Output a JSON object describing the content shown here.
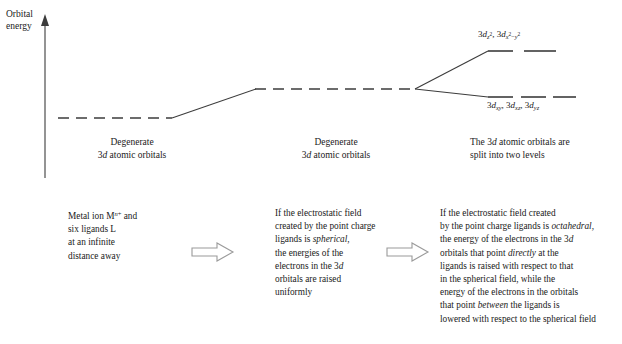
{
  "figure": {
    "axis": {
      "label_line1": "Orbital",
      "label_line2": "energy",
      "name": "orbital-energy-axis"
    },
    "stages": [
      {
        "id": "free-ion",
        "caption_line1": "Degenerate",
        "caption_line2_prefix": "3",
        "caption_line2_italic": "d",
        "caption_line2_suffix": " atomic orbitals",
        "level_style": "dashed",
        "level_y": 118,
        "level_x1": 58,
        "level_x2": 172
      },
      {
        "id": "spherical-field",
        "caption_line1": "Degenerate",
        "caption_line2_prefix": "3",
        "caption_line2_italic": "d",
        "caption_line2_suffix": " atomic orbitals",
        "level_style": "dashed",
        "level_y": 89,
        "level_x1": 255,
        "level_x2": 415
      },
      {
        "id": "octahedral-field",
        "caption_line1": "The 3d atomic orbitals are",
        "caption_line2": "split into two levels",
        "level_style": "split",
        "upper_y": 51,
        "lower_y": 97
      }
    ],
    "split_labels": {
      "upper": {
        "name": "eg-orbital-label",
        "text": "3d_z2, 3d_x2-y2",
        "parts": [
          {
            "n": "3",
            "d": "d",
            "sub": "z2"
          },
          {
            "n": "3",
            "d": "d",
            "sub": "x2-y2"
          }
        ]
      },
      "lower": {
        "name": "t2g-orbital-label",
        "text": "3d_xy, 3d_xz, 3d_yz",
        "parts": [
          {
            "n": "3",
            "d": "d",
            "sub": "xy"
          },
          {
            "n": "3",
            "d": "d",
            "sub": "xz"
          },
          {
            "n": "3",
            "d": "d",
            "sub": "yz"
          }
        ]
      }
    },
    "captions": [
      {
        "id": "caption-free-ion",
        "lines": [
          "Metal ion M n+ and",
          "six ligands L",
          "at an infinite",
          "distance away"
        ]
      },
      {
        "id": "caption-spherical",
        "lines": [
          "If the electrostatic field",
          "created by the point charge",
          "ligands is spherical,",
          "the energies of the",
          "electrons in the 3d",
          "orbitals are raised",
          "uniformly"
        ]
      },
      {
        "id": "caption-octahedral",
        "lines": [
          "If the electrostatic field created",
          "by the point charge ligands is octahedral,",
          "the energy of the electrons in the 3d",
          "orbitals that point directly at the",
          "ligands is raised with respect to that",
          "in the spherical field, while the",
          "energy of the electrons in the orbitals",
          "that point between the ligands is",
          "lowered with respect to the spherical field"
        ]
      }
    ],
    "arrows": [
      {
        "id": "arrow-1",
        "x": 189,
        "y": 242
      },
      {
        "id": "arrow-2",
        "x": 384,
        "y": 242
      }
    ],
    "colors": {
      "background": "#ffffff",
      "ink": "#1a1a1a",
      "line": "#3c3c3c",
      "arrow_stroke": "#9a9a9a"
    }
  }
}
